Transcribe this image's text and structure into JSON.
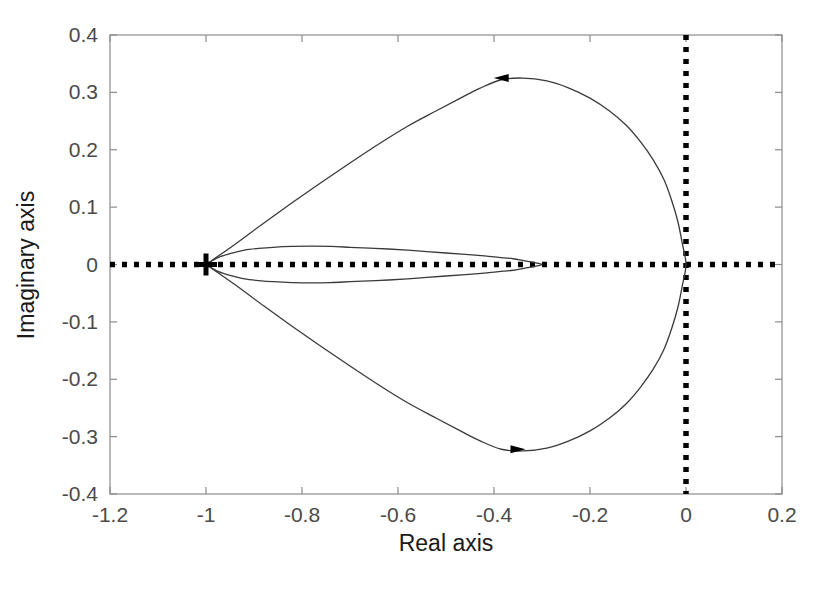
{
  "figure": {
    "type": "nyquist-plot",
    "background": "#ffffff",
    "frame_color": "#8c8c8c",
    "curve_color": "#3a3a3a",
    "axis_line_color": "#000000",
    "tick_label_color": "#4a4a4a",
    "axis_title_color": "#1a1a1a"
  },
  "chart_data": {
    "type": "line",
    "title": "",
    "xlabel": "Real axis",
    "ylabel": "Imaginary axis",
    "xlim": [
      -1.2,
      0.2
    ],
    "ylim": [
      -0.4,
      0.4
    ],
    "xticks": [
      -1.2,
      -1,
      -0.8,
      -0.6,
      -0.4,
      -0.2,
      0,
      0.2
    ],
    "yticks": [
      -0.4,
      -0.3,
      -0.2,
      -0.1,
      0,
      0.1,
      0.2,
      0.3,
      0.4
    ],
    "xticklabels": [
      "-1.2",
      "-1",
      "-0.8",
      "-0.6",
      "-0.4",
      "-0.2",
      "0",
      "0.2"
    ],
    "yticklabels": [
      "-0.4",
      "-0.3",
      "-0.2",
      "-0.1",
      "0",
      "0.1",
      "0.2",
      "0.3",
      "0.4"
    ],
    "grid": false,
    "legend": null,
    "markers": [
      {
        "name": "critical-point",
        "symbol": "plus",
        "x": -1.0,
        "y": 0.0,
        "color": "#000000"
      }
    ],
    "reference_lines": [
      {
        "name": "real-axis-dotted-line",
        "orientation": "horizontal",
        "value": 0.0,
        "style": "dotted",
        "color": "#000000"
      },
      {
        "name": "imaginary-axis-dotted-line",
        "orientation": "vertical",
        "value": 0.0,
        "style": "dotted",
        "color": "#000000"
      }
    ],
    "annotations": [
      {
        "name": "upper-direction-arrow",
        "type": "arrowhead",
        "x": -0.385,
        "y": 0.325,
        "direction": "left"
      },
      {
        "name": "lower-direction-arrow",
        "type": "arrowhead",
        "x": -0.35,
        "y": -0.322,
        "direction": "right"
      }
    ],
    "series": [
      {
        "name": "outer-loop",
        "closed": true,
        "points": [
          [
            -1.0,
            0.0
          ],
          [
            -0.94,
            0.035
          ],
          [
            -0.88,
            0.072
          ],
          [
            -0.82,
            0.108
          ],
          [
            -0.76,
            0.143
          ],
          [
            -0.7,
            0.177
          ],
          [
            -0.64,
            0.21
          ],
          [
            -0.58,
            0.241
          ],
          [
            -0.52,
            0.268
          ],
          [
            -0.47,
            0.29
          ],
          [
            -0.43,
            0.307
          ],
          [
            -0.385,
            0.322
          ],
          [
            -0.34,
            0.325
          ],
          [
            -0.29,
            0.32
          ],
          [
            -0.245,
            0.308
          ],
          [
            -0.2,
            0.29
          ],
          [
            -0.16,
            0.268
          ],
          [
            -0.125,
            0.243
          ],
          [
            -0.095,
            0.214
          ],
          [
            -0.068,
            0.182
          ],
          [
            -0.046,
            0.148
          ],
          [
            -0.03,
            0.112
          ],
          [
            -0.017,
            0.075
          ],
          [
            -0.008,
            0.038
          ],
          [
            0.0,
            0.0
          ],
          [
            -0.008,
            -0.038
          ],
          [
            -0.017,
            -0.075
          ],
          [
            -0.03,
            -0.112
          ],
          [
            -0.046,
            -0.148
          ],
          [
            -0.068,
            -0.182
          ],
          [
            -0.095,
            -0.214
          ],
          [
            -0.125,
            -0.243
          ],
          [
            -0.16,
            -0.268
          ],
          [
            -0.2,
            -0.29
          ],
          [
            -0.245,
            -0.308
          ],
          [
            -0.29,
            -0.32
          ],
          [
            -0.34,
            -0.325
          ],
          [
            -0.385,
            -0.322
          ],
          [
            -0.43,
            -0.307
          ],
          [
            -0.47,
            -0.29
          ],
          [
            -0.52,
            -0.268
          ],
          [
            -0.58,
            -0.241
          ],
          [
            -0.64,
            -0.21
          ],
          [
            -0.7,
            -0.177
          ],
          [
            -0.76,
            -0.143
          ],
          [
            -0.82,
            -0.108
          ],
          [
            -0.88,
            -0.072
          ],
          [
            -0.94,
            -0.035
          ],
          [
            -1.0,
            0.0
          ]
        ]
      },
      {
        "name": "inner-loop",
        "closed": true,
        "points": [
          [
            -1.0,
            0.0
          ],
          [
            -0.975,
            0.012
          ],
          [
            -0.95,
            0.019
          ],
          [
            -0.92,
            0.025
          ],
          [
            -0.89,
            0.028
          ],
          [
            -0.86,
            0.03
          ],
          [
            -0.82,
            0.0315
          ],
          [
            -0.78,
            0.032
          ],
          [
            -0.74,
            0.0315
          ],
          [
            -0.7,
            0.03
          ],
          [
            -0.66,
            0.0285
          ],
          [
            -0.62,
            0.027
          ],
          [
            -0.58,
            0.025
          ],
          [
            -0.54,
            0.0225
          ],
          [
            -0.5,
            0.02
          ],
          [
            -0.46,
            0.0175
          ],
          [
            -0.42,
            0.015
          ],
          [
            -0.39,
            0.0125
          ],
          [
            -0.36,
            0.01
          ],
          [
            -0.34,
            0.007
          ],
          [
            -0.32,
            0.004
          ],
          [
            -0.305,
            0.0015
          ],
          [
            -0.3,
            0.0
          ],
          [
            -0.305,
            -0.0015
          ],
          [
            -0.32,
            -0.004
          ],
          [
            -0.34,
            -0.007
          ],
          [
            -0.36,
            -0.01
          ],
          [
            -0.39,
            -0.0125
          ],
          [
            -0.42,
            -0.015
          ],
          [
            -0.46,
            -0.0175
          ],
          [
            -0.5,
            -0.02
          ],
          [
            -0.54,
            -0.0225
          ],
          [
            -0.58,
            -0.025
          ],
          [
            -0.62,
            -0.027
          ],
          [
            -0.66,
            -0.0285
          ],
          [
            -0.7,
            -0.03
          ],
          [
            -0.74,
            -0.0315
          ],
          [
            -0.78,
            -0.032
          ],
          [
            -0.82,
            -0.0315
          ],
          [
            -0.86,
            -0.03
          ],
          [
            -0.89,
            -0.028
          ],
          [
            -0.92,
            -0.025
          ],
          [
            -0.95,
            -0.019
          ],
          [
            -0.975,
            -0.012
          ],
          [
            -1.0,
            0.0
          ]
        ]
      }
    ]
  }
}
